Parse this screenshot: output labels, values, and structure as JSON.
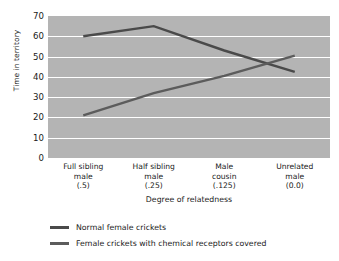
{
  "chart_data": {
    "type": "line",
    "title": "",
    "xlabel": "Degree of relatedness",
    "ylabel": "Time in territory",
    "categories": [
      "Full sibling\nmale\n(.5)",
      "Half sibling\nmale\n(.25)",
      "Male\ncousin\n(.125)",
      "Unrelated\nmale\n(0.0)"
    ],
    "category_lines": [
      [
        "Full sibling",
        "male",
        "(.5)"
      ],
      [
        "Half sibling",
        "male",
        "(.25)"
      ],
      [
        "Male",
        "cousin",
        "(.125)"
      ],
      [
        "Unrelated",
        "male",
        "(0.0)"
      ]
    ],
    "ylim": [
      0,
      70
    ],
    "yticks": [
      70,
      60,
      50,
      40,
      30,
      20,
      10,
      0
    ],
    "grid": true,
    "legend_position": "below",
    "series": [
      {
        "name": "Normal female crickets",
        "values": [
          60,
          65,
          53,
          42.5
        ],
        "color": "#4a4a4a"
      },
      {
        "name": "Female crickets with chemical receptors covered",
        "values": [
          21,
          32,
          40.5,
          50.5
        ],
        "color": "#5c5c5c"
      }
    ]
  },
  "legend": {
    "items": [
      {
        "label": "Normal female crickets",
        "color": "#4a4a4a"
      },
      {
        "label": "Female crickets with chemical receptors covered",
        "color": "#5c5c5c"
      }
    ]
  },
  "colors": {
    "plot_background": "#b4b4b4",
    "gridline": "#ffffff",
    "page_background": "#ffffff",
    "text": "#1a1a1a"
  }
}
